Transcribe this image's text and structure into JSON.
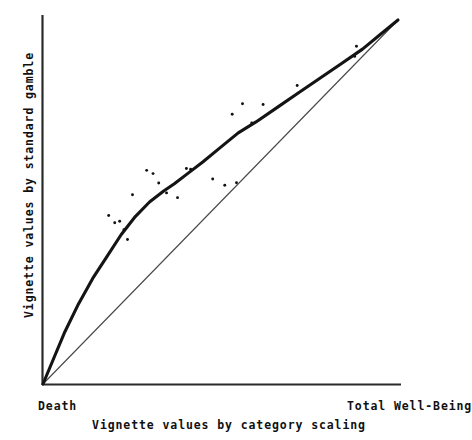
{
  "chart_data": {
    "type": "line",
    "title": "",
    "subtitle": "",
    "xlabel": "Vignette values by category scaling",
    "ylabel": "Vignette values by standard gamble",
    "xlim": [
      0,
      1
    ],
    "ylim": [
      0,
      1
    ],
    "grid": false,
    "legend_position": "none",
    "axis_endpoint_labels": {
      "x_min": "Death",
      "x_max": "Total Well-Being"
    },
    "series": [
      {
        "name": "Fitted mapping curve",
        "type": "line",
        "style": "thick",
        "color": "#1a1a1a",
        "x": [
          0.0,
          0.03,
          0.06,
          0.1,
          0.14,
          0.18,
          0.22,
          0.26,
          0.3,
          0.34,
          0.37,
          0.41,
          0.45,
          0.5,
          0.55,
          0.6,
          0.66,
          0.72,
          0.78,
          0.84,
          0.9,
          0.95,
          1.0
        ],
        "y": [
          0.0,
          0.07,
          0.14,
          0.22,
          0.29,
          0.35,
          0.41,
          0.46,
          0.5,
          0.53,
          0.55,
          0.58,
          0.61,
          0.65,
          0.69,
          0.72,
          0.76,
          0.8,
          0.84,
          0.88,
          0.92,
          0.96,
          1.0
        ]
      },
      {
        "name": "Identity reference line",
        "type": "line",
        "style": "thin",
        "color": "#4a4a4a",
        "x": [
          0.0,
          1.0
        ],
        "y": [
          0.0,
          1.0
        ]
      },
      {
        "name": "Vignette observations",
        "type": "scatter",
        "color": "#111111",
        "points": [
          [
            0.185,
            0.463
          ],
          [
            0.202,
            0.443
          ],
          [
            0.216,
            0.447
          ],
          [
            0.228,
            0.424
          ],
          [
            0.238,
            0.397
          ],
          [
            0.252,
            0.52
          ],
          [
            0.292,
            0.587
          ],
          [
            0.31,
            0.578
          ],
          [
            0.326,
            0.552
          ],
          [
            0.348,
            0.525
          ],
          [
            0.379,
            0.512
          ],
          [
            0.404,
            0.592
          ],
          [
            0.416,
            0.59
          ],
          [
            0.478,
            0.563
          ],
          [
            0.512,
            0.546
          ],
          [
            0.533,
            0.741
          ],
          [
            0.545,
            0.553
          ],
          [
            0.562,
            0.77
          ],
          [
            0.588,
            0.717
          ],
          [
            0.62,
            0.768
          ],
          [
            0.716,
            0.82
          ],
          [
            0.883,
            0.928
          ],
          [
            0.878,
            0.9
          ]
        ]
      }
    ]
  },
  "figure": {
    "xaxis_title": "Vignette values by category scaling",
    "yaxis_title": "Vignette values by standard gamble",
    "x_min_label": "Death",
    "x_max_label": "Total Well-Being"
  }
}
